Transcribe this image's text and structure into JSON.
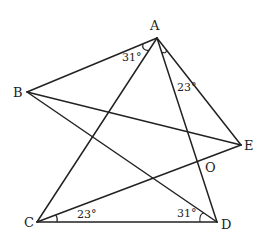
{
  "figure": {
    "type": "geometry",
    "points": {
      "A": {
        "label": "A",
        "x": 157,
        "y": 38,
        "lx": 150,
        "ly": 30
      },
      "B": {
        "label": "B",
        "x": 27,
        "y": 92,
        "lx": 13,
        "ly": 97
      },
      "C": {
        "label": "C",
        "x": 37,
        "y": 222,
        "lx": 24,
        "ly": 227
      },
      "D": {
        "label": "D",
        "x": 217,
        "y": 222,
        "lx": 221,
        "ly": 229
      },
      "E": {
        "label": "E",
        "x": 241,
        "y": 145,
        "lx": 244,
        "ly": 150
      },
      "O": {
        "label": "O",
        "x": 199,
        "y": 161,
        "lx": 205,
        "ly": 172
      }
    },
    "segments": [
      [
        "A",
        "B"
      ],
      [
        "A",
        "C"
      ],
      [
        "A",
        "D"
      ],
      [
        "A",
        "E"
      ],
      [
        "B",
        "E"
      ],
      [
        "B",
        "D"
      ],
      [
        "C",
        "D"
      ],
      [
        "C",
        "E"
      ]
    ],
    "angles": [
      {
        "name": "angle-BAC",
        "label": "31°",
        "lx": 120,
        "ly": 60
      },
      {
        "name": "angle-DAE",
        "label": "23°",
        "lx": 177,
        "ly": 91
      },
      {
        "name": "angle-ECD",
        "label": "23°",
        "lx": 77,
        "ly": 218
      },
      {
        "name": "angle-CDB",
        "label": "31°",
        "lx": 177,
        "ly": 217
      }
    ]
  }
}
